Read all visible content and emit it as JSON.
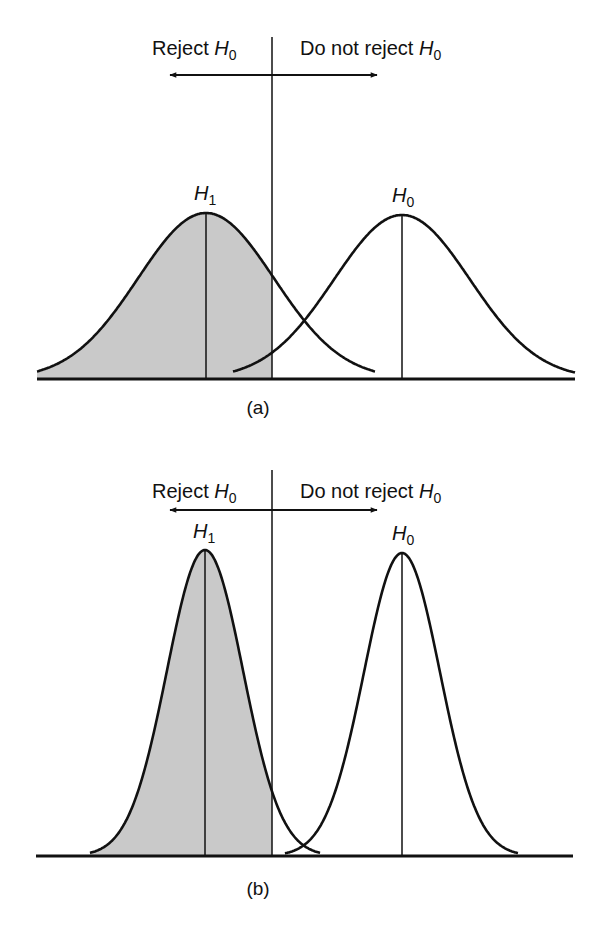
{
  "figure": {
    "colors": {
      "ink": "#111111",
      "shade": "#c9c9c9",
      "background": "#ffffff"
    },
    "panels": [
      {
        "id": "a",
        "caption": "(a)",
        "caption_pos": [
          258,
          414
        ],
        "reject_label": {
          "text": "Reject ",
          "sym": "H",
          "sub": "0",
          "x": 152,
          "y": 55
        },
        "accept_label": {
          "text": "Do not reject ",
          "sym": "H",
          "sub": "0",
          "x": 300,
          "y": 55
        },
        "divider": {
          "x": 272,
          "y1": 37,
          "y2": 380
        },
        "arrow": {
          "x1": 170,
          "x2": 377,
          "y": 75
        },
        "baseline": {
          "x1": 37,
          "x2": 575,
          "y": 379
        },
        "h1": {
          "label_sym": "H",
          "label_sub": "1",
          "mean_x": 206,
          "peak_y": 213,
          "sigma": 68,
          "x_start": 37,
          "x_end": 375,
          "label_x": 194,
          "label_y": 200
        },
        "h0": {
          "label_sym": "H",
          "label_sub": "0",
          "mean_x": 402,
          "peak_y": 215,
          "sigma": 68,
          "x_start": 233,
          "x_end": 575,
          "label_x": 392,
          "label_y": 202
        }
      },
      {
        "id": "b",
        "caption": "(b)",
        "caption_pos": [
          258,
          895
        ],
        "reject_label": {
          "text": "Reject ",
          "sym": "H",
          "sub": "0",
          "x": 152,
          "y": 498
        },
        "accept_label": {
          "text": "Do not reject ",
          "sym": "H",
          "sub": "0",
          "x": 300,
          "y": 498
        },
        "divider": {
          "x": 272,
          "y1": 470,
          "y2": 857
        },
        "arrow": {
          "x1": 170,
          "x2": 377,
          "y": 510
        },
        "baseline": {
          "x1": 36,
          "x2": 573,
          "y": 856
        },
        "h1": {
          "label_sym": "H",
          "label_sub": "1",
          "mean_x": 205,
          "peak_y": 550,
          "sigma": 38,
          "x_start": 90,
          "x_end": 320,
          "label_x": 193,
          "label_y": 538
        },
        "h0": {
          "label_sym": "H",
          "label_sub": "0",
          "mean_x": 402,
          "peak_y": 553,
          "sigma": 38,
          "x_start": 285,
          "x_end": 518,
          "label_x": 392,
          "label_y": 540
        }
      }
    ]
  }
}
